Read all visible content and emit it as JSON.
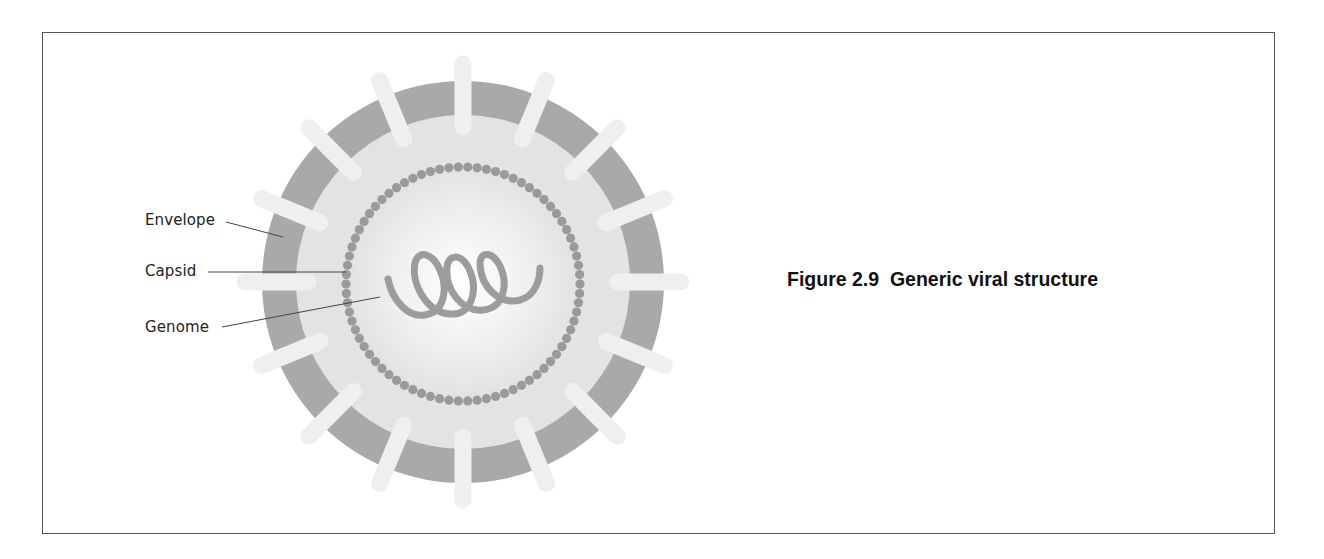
{
  "figure": {
    "caption": "Figure 2.9  Generic viral structure",
    "number": "2.9",
    "title": "Generic viral structure"
  },
  "labels": [
    {
      "id": "envelope",
      "text": "Envelope"
    },
    {
      "id": "capsid",
      "text": "Capsid"
    },
    {
      "id": "genome",
      "text": "Genome"
    }
  ],
  "virus": {
    "spike_count": 16,
    "colors": {
      "envelope_band": "#a9a9a9",
      "inner_fill": "#e4e4e4",
      "center_highlight": "#ffffff",
      "capsid_dots": "#9a9a9a",
      "genome": "#9c9c9c",
      "spikes": "#efefef",
      "leader_lines": "#444444"
    }
  }
}
